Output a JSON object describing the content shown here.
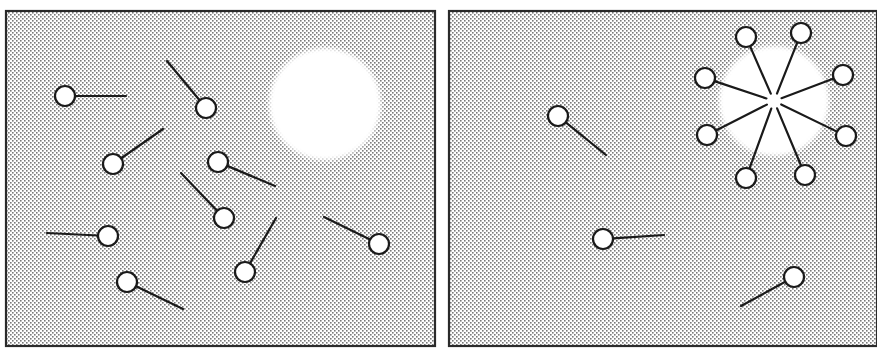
{
  "diagram": {
    "type": "surfactant-micelle-formation",
    "colors": {
      "background": "#ffffff",
      "panel_border": "#2a2a2a",
      "dot": "#7a7a7a",
      "molecule_stroke": "#1a1a1a",
      "head_fill": "#ffffff",
      "core_fill": "#ffffff"
    },
    "panels": [
      {
        "id": "left",
        "label": "dispersed-monomers",
        "rect": {
          "x": 6,
          "y": 11,
          "w": 429,
          "h": 335
        },
        "white_region": {
          "cx": 325,
          "cy": 104,
          "r": 56
        },
        "molecules": [
          {
            "head": [
              65,
              96
            ],
            "tail": [
              126,
              96
            ]
          },
          {
            "head": [
              206,
              108
            ],
            "tail": [
              167,
              61
            ]
          },
          {
            "head": [
              113,
              164
            ],
            "tail": [
              163,
              129
            ]
          },
          {
            "head": [
              218,
              162
            ],
            "tail": [
              275,
              186
            ]
          },
          {
            "head": [
              224,
              218
            ],
            "tail": [
              181,
              173
            ]
          },
          {
            "head": [
              108,
              236
            ],
            "tail": [
              47,
              233
            ]
          },
          {
            "head": [
              127,
              282
            ],
            "tail": [
              183,
              309
            ]
          },
          {
            "head": [
              245,
              272
            ],
            "tail": [
              276,
              218
            ]
          },
          {
            "head": [
              379,
              244
            ],
            "tail": [
              324,
              217
            ]
          }
        ]
      },
      {
        "id": "right",
        "label": "micelle-with-monomers",
        "rect": {
          "x": 449,
          "y": 11,
          "w": 428,
          "h": 335
        },
        "white_region": {
          "cx": 774,
          "cy": 101,
          "r": 55
        },
        "molecules": [
          {
            "head": [
              558,
              116
            ],
            "tail": [
              606,
              155
            ]
          },
          {
            "head": [
              603,
              239
            ],
            "tail": [
              664,
              235
            ]
          },
          {
            "head": [
              794,
              277
            ],
            "tail": [
              741,
              306
            ]
          }
        ],
        "micelle": {
          "center": [
            774,
            101
          ],
          "inner_gap": 8,
          "heads": [
            [
              746,
              37
            ],
            [
              801,
              33
            ],
            [
              843,
              75
            ],
            [
              846,
              136
            ],
            [
              805,
              175
            ],
            [
              746,
              178
            ],
            [
              707,
              135
            ],
            [
              705,
              78
            ]
          ]
        }
      }
    ],
    "head_radius": 10
  }
}
